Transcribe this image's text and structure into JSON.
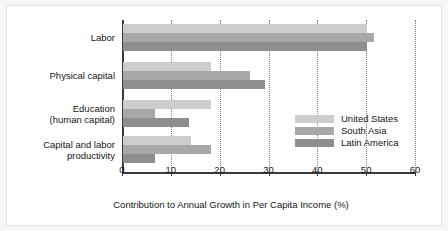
{
  "chart_data": {
    "type": "bar",
    "orientation": "horizontal",
    "title": "",
    "xlabel": "Contribution to Annual Growth in Per Capita Income (%)",
    "ylabel": "",
    "xlim": [
      0,
      60
    ],
    "xticks": [
      0,
      10,
      20,
      30,
      40,
      50,
      60
    ],
    "grid": true,
    "grid_axis": "x",
    "grid_style": "dotted",
    "legend_position": "center-right",
    "categories": [
      "Labor",
      "Physical capital",
      "Education\n(human capital)",
      "Capital and labor\nproductivity"
    ],
    "category_labels": [
      [
        "Labor"
      ],
      [
        "Physical capital"
      ],
      [
        "Education",
        "(human capital)"
      ],
      [
        "Capital and labor",
        "productivity"
      ]
    ],
    "series": [
      {
        "name": "United States",
        "color": "#cdcdcd",
        "values": [
          50,
          18,
          18,
          14
        ]
      },
      {
        "name": "South Asia",
        "color": "#a8a8a8",
        "values": [
          51.5,
          26,
          6.5,
          18
        ]
      },
      {
        "name": "Latin America",
        "color": "#8e8e8e",
        "values": [
          50,
          29,
          13.5,
          6.5
        ]
      }
    ]
  },
  "legend": {
    "entries": [
      {
        "label": "United States"
      },
      {
        "label": "South Asia"
      },
      {
        "label": "Latin America"
      }
    ]
  },
  "axis": {
    "x_tick_labels": [
      "0",
      "10",
      "20",
      "30",
      "40",
      "50",
      "60"
    ],
    "x_title": "Contribution to Annual Growth in Per Capita Income (%)"
  }
}
